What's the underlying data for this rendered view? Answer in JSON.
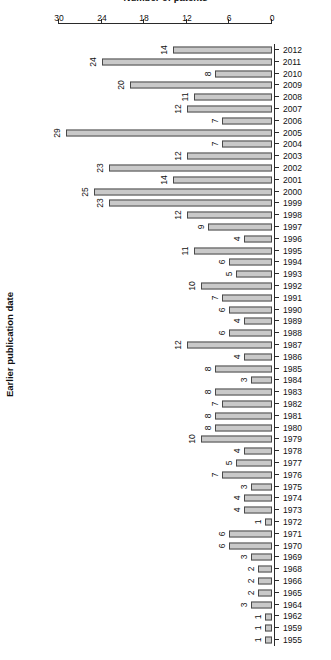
{
  "chart_data": {
    "type": "bar",
    "orientation": "horizontal",
    "title": "",
    "subtitle": "",
    "xlabel": "Number of patents",
    "ylabel": "Earlier publication date",
    "xlim": [
      0,
      30
    ],
    "xticks": [
      0,
      6,
      12,
      18,
      24,
      30
    ],
    "xtick_labels": [
      "0",
      "6",
      "12",
      "18",
      "24",
      "30"
    ],
    "grid": false,
    "legend": null,
    "bar_labels_shown": true,
    "rotation_degrees": 180,
    "categories": [
      "1955",
      "1959",
      "1962",
      "1964",
      "1965",
      "1966",
      "1968",
      "1969",
      "1970",
      "1971",
      "1972",
      "1973",
      "1974",
      "1975",
      "1976",
      "1977",
      "1978",
      "1979",
      "1980",
      "1981",
      "1982",
      "1983",
      "1984",
      "1985",
      "1986",
      "1987",
      "1988",
      "1989",
      "1990",
      "1991",
      "1992",
      "1993",
      "1994",
      "1995",
      "1996",
      "1997",
      "1998",
      "1999",
      "2000",
      "2001",
      "2002",
      "2003",
      "2004",
      "2005",
      "2006",
      "2007",
      "2008",
      "2009",
      "2010",
      "2011",
      "2012"
    ],
    "values": [
      1,
      1,
      1,
      3,
      2,
      2,
      2,
      3,
      6,
      6,
      1,
      4,
      4,
      3,
      7,
      5,
      4,
      10,
      8,
      8,
      7,
      8,
      3,
      8,
      4,
      12,
      6,
      4,
      6,
      7,
      10,
      5,
      6,
      11,
      4,
      9,
      12,
      23,
      25,
      14,
      23,
      12,
      7,
      29,
      7,
      12,
      11,
      20,
      8,
      24,
      14
    ]
  },
  "style": {
    "bar_fill": "#c9c9c9",
    "bar_border": "#4a4a4a",
    "axis_color": "#2a2a2a",
    "text_color": "#111111",
    "background": "#ffffff"
  }
}
